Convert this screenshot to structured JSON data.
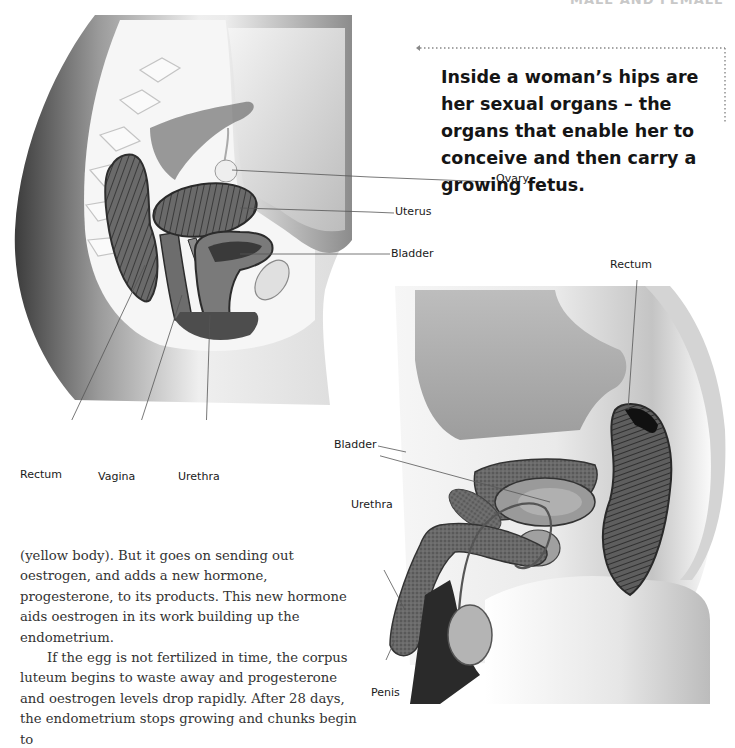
{
  "page": {
    "header": "MALE AND FEMALE"
  },
  "callout": {
    "text": "Inside a woman’s hips are her sexual organs – the organs that enable her to conceive and then carry a growing fetus.",
    "arrow_direction": "left",
    "arrow_style": "dotted"
  },
  "female_diagram": {
    "labels": {
      "ovary": "Ovary",
      "uterus": "Uterus",
      "bladder": "Bladder",
      "rectum": "Rectum",
      "vagina": "Vagina",
      "urethra": "Urethra"
    }
  },
  "male_diagram": {
    "labels": {
      "rectum": "Rectum",
      "bladder": "Bladder",
      "urethra": "Urethra",
      "penis": "Penis"
    }
  },
  "body_text": {
    "paragraphs": [
      "(yellow body). But it goes on sending out oestrogen, and adds a new hormone, progesterone, to its products. This new hormone aids oestrogen in its work building up the endometrium.",
      "If the egg is not fertilized in time, the corpus luteum begins to waste away and progesterone and oestrogen levels drop rapidly. After 28 days, the endometrium stops growing and chunks begin to"
    ]
  },
  "colors": {
    "text": "#151515",
    "body_text": "#333333",
    "tissue_dark": "#4a4a4a",
    "tissue_mid": "#8a8a8a",
    "skin_light": "#e6e6e6",
    "leader_line": "#555555",
    "dotted_arrow": "#888888"
  }
}
